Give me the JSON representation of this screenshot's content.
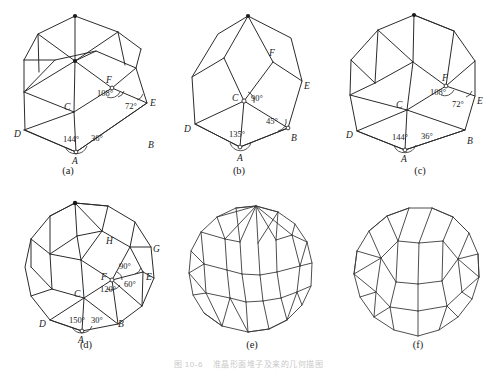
{
  "figure": {
    "caption_number": "图 10-6",
    "caption_text": "准晶形面堆子及来的几何描图",
    "background_color": "#ffffff",
    "line_color": "#2b2b2b",
    "panel_count": 6
  },
  "panels": [
    {
      "id": "a",
      "sub_label": "(a)",
      "shape_name": "rhombic-triacontahedron-partial-net",
      "outline": "decagon",
      "vertex_labels": [
        "A",
        "B",
        "C",
        "D",
        "E",
        "F"
      ],
      "angles": [
        "144°",
        "36°",
        "108°",
        "72°"
      ],
      "angle_at_A_left": "144°",
      "angle_at_A_right": "36°",
      "angle_at_F": "108°",
      "angle_at_E": "72°"
    },
    {
      "id": "b",
      "sub_label": "(b)",
      "shape_name": "rhombic-octahedral-partial-net",
      "outline": "octagon",
      "vertex_labels": [
        "A",
        "B",
        "C",
        "D",
        "E",
        "F"
      ],
      "angles": [
        "135°",
        "45°",
        "90°"
      ],
      "angle_at_A": "135°",
      "angle_at_B": "45°",
      "angle_at_C": "90°"
    },
    {
      "id": "c",
      "sub_label": "(c)",
      "shape_name": "rhombic-decagonal-net",
      "outline": "decagon",
      "vertex_labels": [
        "A",
        "B",
        "C",
        "D",
        "E",
        "F"
      ],
      "angles": [
        "144°",
        "36°",
        "108°",
        "72°"
      ],
      "angle_at_A_left": "144°",
      "angle_at_A_right": "36°",
      "angle_at_F": "108°",
      "angle_at_E": "72°"
    },
    {
      "id": "d",
      "sub_label": "(d)",
      "shape_name": "rhombic-dodecagonal-net",
      "outline": "dodecagon",
      "vertex_labels": [
        "A",
        "B",
        "C",
        "D",
        "E",
        "F",
        "G",
        "H"
      ],
      "angles": [
        "150°",
        "30°",
        "120°",
        "60°",
        "90°"
      ],
      "angle_at_A_left": "150°",
      "angle_at_A_right": "30°",
      "angle_at_C": "120°",
      "angle_at_E": "60°",
      "angle_at_F": "90°"
    },
    {
      "id": "e",
      "sub_label": "(e)",
      "shape_name": "rhombic-polyhedron-full-tiling",
      "outline": "icosagon",
      "vertex_labels": [],
      "angles": []
    },
    {
      "id": "f",
      "sub_label": "(f)",
      "shape_name": "rhombic-triacontahedron-projection",
      "outline": "icosagon",
      "vertex_labels": [],
      "angles": []
    }
  ]
}
